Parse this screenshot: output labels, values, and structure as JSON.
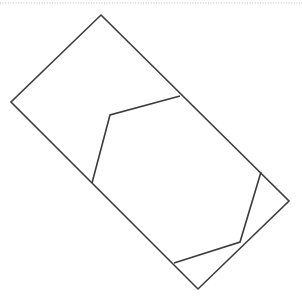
{
  "figure": {
    "width": 302,
    "height": 297,
    "background_color": "#ffffff",
    "stroke_color": "#3c3c3c",
    "stroke_width": 1.6,
    "rule_color": "#b9b9b9",
    "top_rule": {
      "name": "dotted-horizontal-rule",
      "y": 3,
      "x_start": 0,
      "x_end": 302,
      "style": "dotted",
      "color": "#b9b9b9"
    },
    "shapes": [
      {
        "name": "outer-rotated-rectangle",
        "type": "polygon",
        "closed": true,
        "points": [
          [
            101,
            15
          ],
          [
            289,
            201
          ],
          [
            198,
            289
          ],
          [
            11,
            102
          ]
        ],
        "points_attr": "101,15 289,201 198,289 11,102"
      },
      {
        "name": "inner-upper-left-polyline",
        "type": "polyline",
        "closed": false,
        "points": [
          [
            180,
            96
          ],
          [
            110,
            115
          ],
          [
            92,
            183
          ]
        ],
        "points_attr": "180,96 110,115 92,183"
      },
      {
        "name": "inner-lower-right-polyline",
        "type": "polyline",
        "closed": false,
        "points": [
          [
            261,
            172
          ],
          [
            240,
            242
          ],
          [
            174,
            263
          ]
        ],
        "points_attr": "261,172 240,242 174,263"
      }
    ]
  }
}
